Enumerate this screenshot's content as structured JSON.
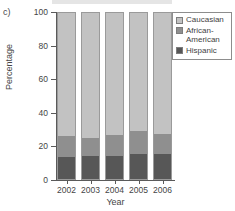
{
  "figure": {
    "panel_label": "c)"
  },
  "legend": {
    "position": "top-right",
    "items": [
      {
        "label": "Caucasian",
        "color": "#c2c2c2",
        "swatch_name": "legend-swatch-caucasian"
      },
      {
        "label": "African-\nAmerican",
        "color": "#8f8f8f",
        "swatch_name": "legend-swatch-african-american"
      },
      {
        "label": "Hispanic",
        "color": "#575757",
        "swatch_name": "legend-swatch-hispanic"
      }
    ]
  },
  "axes": {
    "y_ticks": [
      "0",
      "20",
      "40",
      "60",
      "80",
      "100"
    ],
    "x_ticks": [
      "2002",
      "2003",
      "2004",
      "2005",
      "2006"
    ]
  },
  "chart_data": {
    "type": "bar",
    "stacked": true,
    "stack_mode": "percent",
    "title": "",
    "subtitle": "",
    "xlabel": "Year",
    "ylabel": "Percentage",
    "categories": [
      "2002",
      "2003",
      "2004",
      "2005",
      "2006"
    ],
    "series": [
      {
        "name": "Hispanic",
        "color": "#575757",
        "values": [
          13.5,
          14.0,
          14.5,
          15.5,
          15.5
        ]
      },
      {
        "name": "African-American",
        "color": "#8f8f8f",
        "values": [
          12.5,
          11.0,
          12.5,
          13.5,
          12.0
        ]
      },
      {
        "name": "Caucasian",
        "color": "#c2c2c2",
        "values": [
          74.0,
          75.0,
          73.0,
          71.0,
          72.5
        ]
      }
    ],
    "stack_order_bottom_to_top": [
      "Hispanic",
      "African-American",
      "Caucasian"
    ],
    "ylim": [
      0,
      100
    ],
    "ytick_values": [
      0,
      20,
      40,
      60,
      80,
      100
    ],
    "grid": false,
    "legend_position": "top-right"
  }
}
